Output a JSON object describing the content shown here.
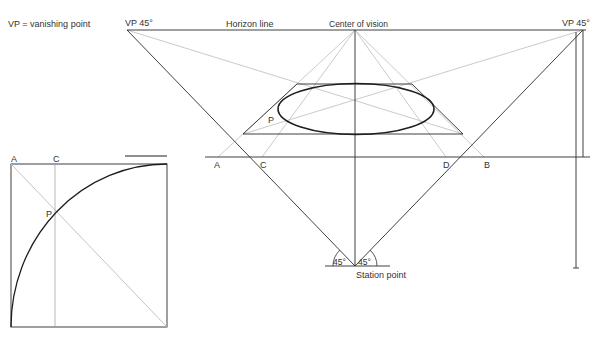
{
  "legend": {
    "text": "VP = vanishing point"
  },
  "labels": {
    "vp_left": "VP 45°",
    "vp_right": "VP 45°",
    "horizon_line": "Horizon line",
    "center_of_vision": "Center of vision",
    "station_point": "Station point",
    "angle_left": "45°",
    "angle_right": "45°",
    "point_p_main": "P",
    "ground_a": "A",
    "ground_c": "C",
    "ground_d": "D",
    "ground_b": "B"
  },
  "inset": {
    "label_a": "A",
    "label_c": "C",
    "label_p": "P"
  },
  "colors": {
    "dark_line": "#2b2b2b",
    "guide_line": "#b8b8b8",
    "ellipse": "#1e1e1e",
    "background": "#ffffff"
  }
}
